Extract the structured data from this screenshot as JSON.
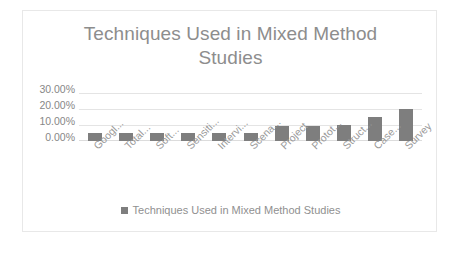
{
  "chart_data": {
    "type": "bar",
    "title": "Techniques Used in Mixed Method\nStudies",
    "xlabel": "",
    "ylabel": "",
    "ylim": [
      0,
      30
    ],
    "grid": true,
    "legend_position": "bottom",
    "categories": [
      "Googl...",
      "Total...",
      "Soft...",
      "Sensiti...",
      "Intervi...",
      "Scena...",
      "Project",
      "Protot...",
      "Struct...",
      "Case...",
      "Survey"
    ],
    "values": [
      5,
      5,
      5,
      5,
      5,
      5,
      9.5,
      9.5,
      10,
      15,
      20
    ],
    "value_suffix": "%",
    "y_ticks": [
      "30.00%",
      "20.00%",
      "10.00%",
      "0.00%"
    ],
    "y_tick_values": [
      30,
      20,
      10,
      0
    ],
    "series": [
      {
        "name": "Techniques Used in Mixed Method Studies",
        "color": "#7e7e7e",
        "values": [
          5,
          5,
          5,
          5,
          5,
          5,
          9.5,
          9.5,
          10,
          15,
          20
        ]
      }
    ]
  },
  "legend": {
    "items": [
      {
        "label": "Techniques Used in Mixed Method Studies",
        "color": "#7e7e7e"
      }
    ]
  },
  "style": {
    "bar_color": "#7e7e7e",
    "title_color": "#8d8d8d",
    "axis_text_color": "#909090",
    "gridline_color": "#e4e4e4",
    "border_color": "#e8e8e8",
    "background": "#ffffff"
  }
}
